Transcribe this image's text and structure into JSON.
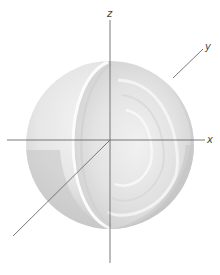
{
  "figure": {
    "axes": {
      "x": {
        "label": "x"
      },
      "y": {
        "label": "y"
      },
      "z": {
        "label": "z"
      }
    },
    "colors": {
      "axis_line": "#6a6a6a",
      "sphere_light": "#f4f4f4",
      "sphere_mid": "#dcdcdc",
      "sphere_dark": "#bdbdbd",
      "label": "#444444"
    }
  }
}
